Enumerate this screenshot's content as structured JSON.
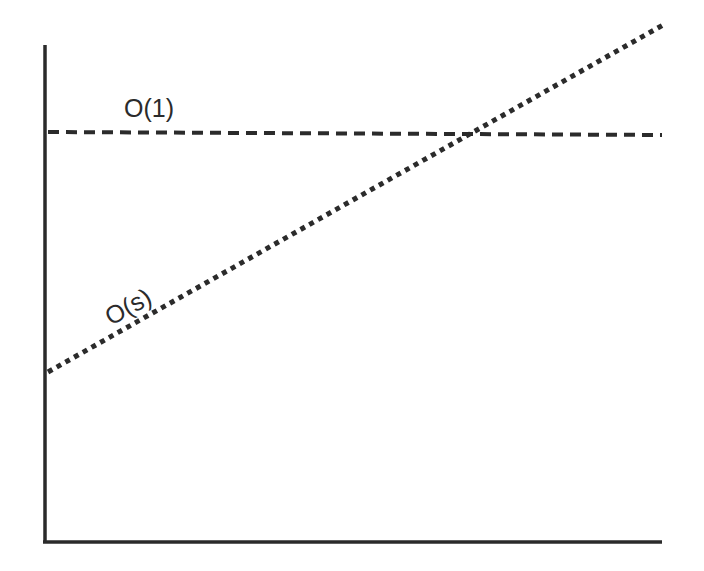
{
  "diagram": {
    "type": "complexity-comparison",
    "axes": {
      "x_axis": {
        "label": "",
        "from": [
          45,
          542
        ],
        "to": [
          662,
          542
        ]
      },
      "y_axis": {
        "label": "",
        "from": [
          45,
          45
        ],
        "to": [
          45,
          542
        ]
      }
    },
    "lines": [
      {
        "name": "constant",
        "label": "O(1)",
        "style": "dashed",
        "from": [
          48,
          132
        ],
        "to": [
          662,
          135
        ]
      },
      {
        "name": "linear",
        "label": "O(s)",
        "style": "dotted",
        "from": [
          48,
          372
        ],
        "to": [
          663,
          25
        ]
      }
    ],
    "colors": {
      "ink": "#2b2b2b",
      "background": "#ffffff"
    }
  }
}
